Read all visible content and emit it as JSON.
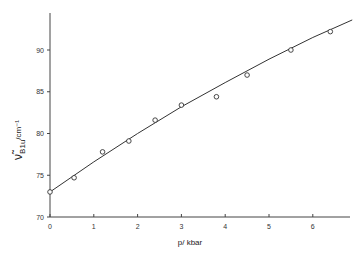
{
  "chart_data": {
    "type": "scatter",
    "title": "",
    "xlabel": "p/ kbar",
    "ylabel": "ν̃B1u / cm⁻¹",
    "ylabel_main": "ν̃",
    "ylabel_sub": "B1u",
    "ylabel_unit": "/cm⁻¹",
    "xlim": [
      0,
      6.9
    ],
    "ylim": [
      70,
      94.5
    ],
    "xticks": [
      "0",
      "1",
      "2",
      "3",
      "4",
      "5",
      "6"
    ],
    "yticks": [
      "70",
      "75",
      "80",
      "85",
      "90"
    ],
    "grid": false,
    "legend": "none",
    "series": [
      {
        "name": "measured",
        "marker": "open-circle",
        "x": [
          0,
          0.55,
          1.2,
          1.8,
          2.4,
          3.0,
          3.8,
          4.5,
          5.5,
          6.4
        ],
        "y": [
          73.0,
          74.7,
          77.8,
          79.1,
          81.6,
          83.4,
          84.4,
          87.0,
          90.0,
          92.2
        ]
      },
      {
        "name": "fit",
        "marker": "line",
        "x": [
          0,
          1,
          2,
          3,
          4,
          5,
          6,
          6.9
        ],
        "y": [
          73.0,
          76.6,
          80.0,
          83.2,
          86.1,
          88.9,
          91.5,
          93.6
        ]
      }
    ]
  }
}
